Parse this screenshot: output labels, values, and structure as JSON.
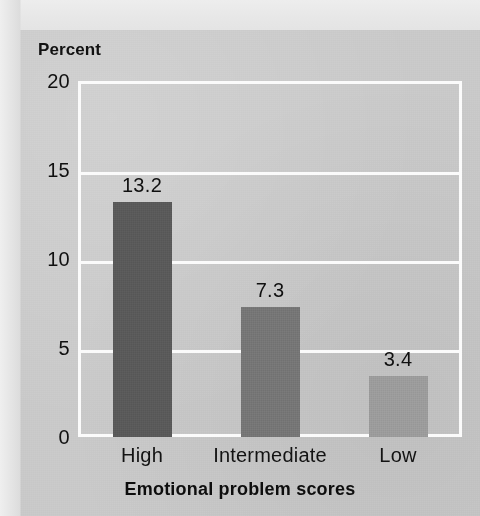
{
  "figure": {
    "title_fragment": "p",
    "y_axis_title": "Percent",
    "x_axis_title": "Emotional problem scores",
    "panel_color": "#c9c9c9",
    "gridline_color": "#fbfbfb",
    "text_color": "#111111"
  },
  "chart_data": {
    "type": "bar",
    "title": "",
    "subtitle": "",
    "xlabel": "Emotional problem scores",
    "ylabel": "Percent",
    "categories": [
      "High",
      "Intermediate",
      "Low"
    ],
    "values": [
      13.2,
      7.3,
      3.4
    ],
    "value_labels": [
      "13.2",
      "7.3",
      "3.4"
    ],
    "ylim": [
      0,
      20
    ],
    "yticks": [
      0,
      5,
      10,
      15,
      20
    ],
    "ytick_labels": [
      "0",
      "5",
      "10",
      "15",
      "20"
    ],
    "grid": true,
    "grid_axis": "y",
    "legend": false,
    "legend_position": "none",
    "bar_colors": [
      "#595959",
      "#757575",
      "#9b9b9b"
    ],
    "series": [
      {
        "name": "Percent",
        "values": [
          13.2,
          7.3,
          3.4
        ]
      }
    ]
  }
}
